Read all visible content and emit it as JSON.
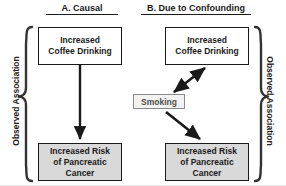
{
  "figure": {
    "background_color": "#ffffff",
    "panels": [
      {
        "id": "a",
        "title": "A. Causal",
        "nodes": [
          {
            "name": "cause",
            "text": "Increased\nCoffee Drinking",
            "line1": "Increased",
            "line2": "Coffee Drinking",
            "fill": "#ffffff"
          },
          {
            "name": "effect",
            "text": "Increased Risk of Pancreatic Cancer",
            "line1": "Increased Risk",
            "line2": "of Pancreatic",
            "line3": "Cancer",
            "fill": "#d9d9d9"
          }
        ],
        "edges": [
          {
            "from": "cause",
            "to": "effect",
            "style": "solid",
            "heads": "single",
            "direction": "down"
          }
        ]
      },
      {
        "id": "b",
        "title": "B. Due to Confounding",
        "nodes": [
          {
            "name": "cause",
            "text": "Increased\nCoffee Drinking",
            "line1": "Increased",
            "line2": "Coffee Drinking",
            "fill": "#ffffff"
          },
          {
            "name": "confounder",
            "text": "Smoking",
            "fill": "#f2f2f2"
          },
          {
            "name": "effect",
            "text": "Increased Risk of Pancreatic Cancer",
            "line1": "Increased Risk",
            "line2": "of Pancreatic",
            "line3": "Cancer",
            "fill": "#d9d9d9"
          }
        ],
        "edges": [
          {
            "from": "confounder",
            "to": "cause",
            "style": "solid",
            "heads": "double",
            "direction": "up-right"
          },
          {
            "from": "confounder",
            "to": "effect",
            "style": "solid",
            "heads": "single",
            "direction": "down-right"
          }
        ]
      }
    ],
    "braces": [
      {
        "side": "left",
        "label": "Observed Association"
      },
      {
        "side": "right",
        "label": "Observed Association"
      }
    ],
    "colors": {
      "stroke": "#1a1a1a",
      "node_fill_white": "#ffffff",
      "node_fill_gray": "#d9d9d9",
      "confounder_fill": "#f2f2f2",
      "confounder_border": "#8a8a8a",
      "confounder_text": "#4d4d4d"
    }
  }
}
